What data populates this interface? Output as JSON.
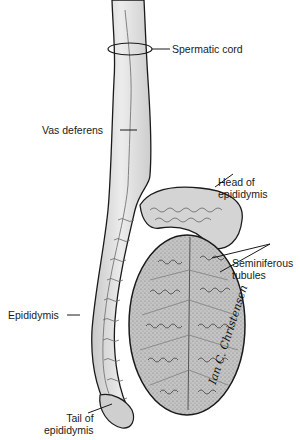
{
  "diagram": {
    "labels": {
      "spermatic_cord": "Spermatic cord",
      "vas_deferens": "Vas deferens",
      "head_of_epididymis_line1": "Head of",
      "head_of_epididymis_line2": "epididymis",
      "seminiferous_tubules_line1": "Seminiferous",
      "seminiferous_tubules_line2": "tubules",
      "epididymis": "Epididymis",
      "tail_of_epididymis_line1": "Tail of",
      "tail_of_epididymis_line2": "epididymis"
    },
    "signature": "Ian C. Christensen",
    "colors": {
      "outline": "#1a1a1a",
      "cord_fill": "#d9d9d9",
      "epididymis_fill": "#cfcfcf",
      "testis_fill": "#b9b9b9",
      "tubule_stroke": "#4a4a4a",
      "background": "#ffffff"
    }
  }
}
